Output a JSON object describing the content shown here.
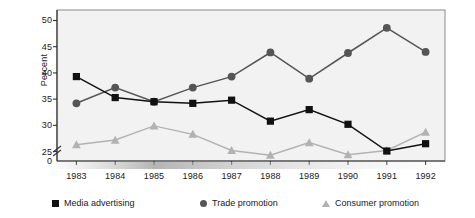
{
  "chart_data": {
    "type": "line",
    "title": "",
    "xlabel": "",
    "ylabel": "Percent",
    "categories": [
      "1983",
      "1984",
      "1985",
      "1986",
      "1987",
      "1988",
      "1989",
      "1990",
      "1991",
      "1992"
    ],
    "series": [
      {
        "name": "Media advertising",
        "marker": "square",
        "color": "#111111",
        "values": [
          39.3,
          35.3,
          34.5,
          34.2,
          34.8,
          30.8,
          33.0,
          30.2,
          25.1,
          26.5
        ]
      },
      {
        "name": "Trade promotion",
        "marker": "circle",
        "color": "#555555",
        "values": [
          34.2,
          37.2,
          34.5,
          37.2,
          39.3,
          43.9,
          38.9,
          43.8,
          48.6,
          44.0
        ]
      },
      {
        "name": "Consumer promotion",
        "marker": "triangle",
        "color": "#b2b2b2",
        "values": [
          26.3,
          27.2,
          29.9,
          28.3,
          25.2,
          24.3,
          26.7,
          24.4,
          25.2,
          28.7
        ]
      }
    ],
    "ylim": [
      23.2,
      52.0
    ],
    "yticks": [
      25,
      30,
      35,
      40,
      45,
      50
    ],
    "ytick_labels": [
      "25",
      "30",
      "35",
      "40",
      "45",
      "50"
    ],
    "axis_break": true,
    "zero_label": "0",
    "grid": false,
    "legend_position": "bottom"
  },
  "colors": {
    "plot_background": "#f2f2f2",
    "plot_border": "#808080",
    "axis": "#333333",
    "media": "#111111",
    "trade": "#555555",
    "consumer": "#b2b2b2"
  }
}
